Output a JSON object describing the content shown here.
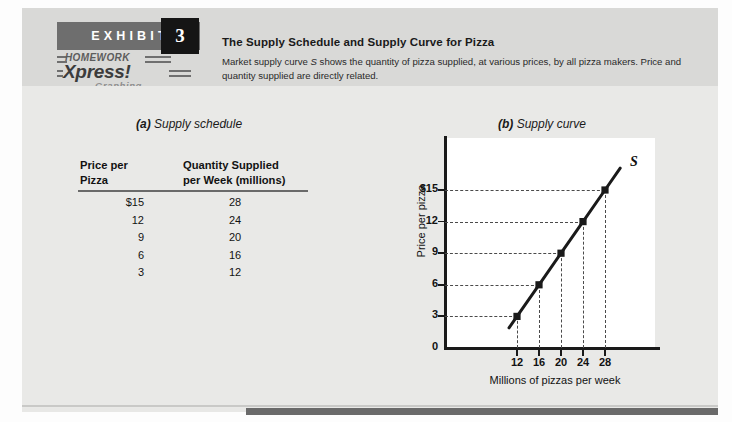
{
  "exhibit": {
    "label": "EXHIBIT",
    "number": "3",
    "logo": {
      "top_text": "HOMEWORK",
      "main_text": "Xpress!",
      "sub_text": "Graphing"
    },
    "title": "The Supply Schedule and Supply Curve for Pizza",
    "caption_part1": "Market supply curve ",
    "caption_italic": "S",
    "caption_part2": " shows the quantity of pizza supplied, at various prices, by all pizza makers. Price and quantity supplied are directly related."
  },
  "panel_a": {
    "letter": "(a)",
    "label": " Supply schedule",
    "header_price_line1": "Price per",
    "header_price_line2": "Pizza",
    "header_qty_line1": "Quantity Supplied",
    "header_qty_line2": "per Week (millions)",
    "rows": [
      {
        "price": "$15",
        "quantity": "28"
      },
      {
        "price": "12",
        "quantity": "24"
      },
      {
        "price": "9",
        "quantity": "20"
      },
      {
        "price": "6",
        "quantity": "16"
      },
      {
        "price": "3",
        "quantity": "12"
      }
    ]
  },
  "panel_b": {
    "letter": "(b)",
    "label": " Supply curve",
    "curve_label": "S"
  },
  "chart_data": {
    "type": "line",
    "title": "Supply curve",
    "xlabel": "Millions of pizzas per week",
    "ylabel": "Price per pizza",
    "xlim": [
      0,
      32
    ],
    "ylim": [
      0,
      18
    ],
    "xticks": [
      "12",
      "16",
      "20",
      "24",
      "28"
    ],
    "xtick_values": [
      12,
      16,
      20,
      24,
      28
    ],
    "yticks": [
      "0",
      "3",
      "6",
      "9",
      "12",
      "$15"
    ],
    "ytick_values": [
      0,
      3,
      6,
      9,
      12,
      15
    ],
    "grid": "dashed-guides",
    "legend": "none",
    "series": [
      {
        "name": "S",
        "x": [
          12,
          16,
          20,
          24,
          28
        ],
        "y": [
          3,
          6,
          9,
          12,
          15
        ],
        "marker": "square",
        "color": "#1a1a1a"
      }
    ],
    "annotations": [
      {
        "text": "S",
        "x": 29.6,
        "y": 16.6
      }
    ]
  }
}
